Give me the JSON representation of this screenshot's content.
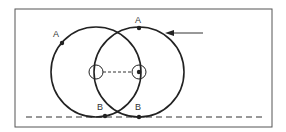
{
  "diagram": {
    "frame": {
      "x": 15,
      "y": 9,
      "width": 257,
      "height": 118,
      "stroke": "#555555"
    },
    "baseline": {
      "x1": 26,
      "x2": 266,
      "y": 117,
      "style": "dashed"
    },
    "circles": [
      {
        "name": "left-circle",
        "cx": 96,
        "cy": 72,
        "r": 45
      },
      {
        "name": "right-circle",
        "cx": 139,
        "cy": 72,
        "r": 45
      }
    ],
    "centers": [
      {
        "name": "left-center-marker",
        "cx": 96,
        "cy": 72,
        "r": 7,
        "filled_dot": false
      },
      {
        "name": "right-center-marker",
        "cx": 139,
        "cy": 72,
        "r": 7,
        "filled_dot": true
      }
    ],
    "center_link": {
      "x1": 103,
      "x2": 132,
      "y": 72,
      "style": "dashed"
    },
    "points": [
      {
        "label": "A",
        "x": 62,
        "y": 43,
        "label_x": 53,
        "label_y": 37
      },
      {
        "label": "A",
        "x": 139,
        "y": 28,
        "label_x": 135,
        "label_y": 23
      },
      {
        "label": "B",
        "x": 105,
        "y": 116,
        "label_x": 97,
        "label_y": 110
      },
      {
        "label": "B",
        "x": 139,
        "y": 117,
        "label_x": 135,
        "label_y": 110
      }
    ],
    "arrow": {
      "x1": 203,
      "y1": 33,
      "x2": 166,
      "y2": 33
    }
  }
}
